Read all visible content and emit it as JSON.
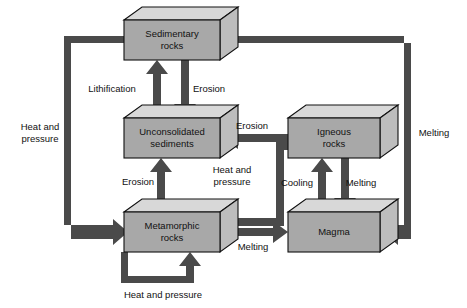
{
  "diagram": {
    "type": "flow-diagram",
    "colors": {
      "box_front": "#a8a8a8",
      "box_top": "#d8d8d8",
      "box_side": "#bdbdbd",
      "box_outline": "#101010",
      "arrow": "#4a4a4a",
      "text": "#111111",
      "background": "#ffffff"
    },
    "nodes": [
      {
        "id": "sedimentary",
        "label_line1": "Sedimentary",
        "label_line2": "rocks",
        "x": 124,
        "y": 20,
        "w": 96,
        "h": 40
      },
      {
        "id": "unconsolidated",
        "label_line1": "Unconsolidated",
        "label_line2": "sediments",
        "x": 124,
        "y": 118,
        "w": 96,
        "h": 40
      },
      {
        "id": "igneous",
        "label_line1": "Igneous",
        "label_line2": "rocks",
        "x": 288,
        "y": 118,
        "w": 92,
        "h": 40
      },
      {
        "id": "metamorphic",
        "label_line1": "Metamorphic",
        "label_line2": "rocks",
        "x": 124,
        "y": 212,
        "w": 96,
        "h": 40
      },
      {
        "id": "magma",
        "label_line1": "Magma",
        "label_line2": "",
        "x": 288,
        "y": 212,
        "w": 92,
        "h": 40
      }
    ],
    "edges": [
      {
        "id": "lithification",
        "label": "Lithification",
        "from": "unconsolidated",
        "to": "sedimentary",
        "label_x": 112,
        "label_y": 89
      },
      {
        "id": "erosion-sed-to-unc",
        "label": "Erosion",
        "from": "sedimentary",
        "to": "unconsolidated",
        "label_x": 209,
        "label_y": 89
      },
      {
        "id": "erosion-ign-to-unc",
        "label": "Erosion",
        "from": "igneous",
        "to": "unconsolidated",
        "label_x": 252,
        "label_y": 126
      },
      {
        "id": "erosion-met-to-unc",
        "label": "Erosion",
        "from": "metamorphic",
        "to": "unconsolidated",
        "label_x": 138,
        "label_y": 182
      },
      {
        "id": "heat-pressure-ign-to-met",
        "label_line1": "Heat and",
        "label_line2": "pressure",
        "from": "igneous",
        "to": "metamorphic",
        "label_x": 232,
        "label_y": 176
      },
      {
        "id": "cooling-magma-to-ign",
        "label": "Cooling",
        "from": "magma",
        "to": "igneous",
        "label_x": 297,
        "label_y": 183
      },
      {
        "id": "melting-ign-to-magma",
        "label": "Melting",
        "from": "igneous",
        "to": "magma",
        "label_x": 361,
        "label_y": 183
      },
      {
        "id": "melting-met-to-magma",
        "label": "Melting",
        "from": "metamorphic",
        "to": "magma",
        "label_x": 253,
        "label_y": 243
      },
      {
        "id": "heat-pressure-sed-to-met",
        "label_line1": "Heat and",
        "label_line2": "pressure",
        "from": "sedimentary",
        "to": "metamorphic",
        "label_x": 40,
        "label_y": 133
      },
      {
        "id": "melting-sed-to-magma",
        "label": "Melting",
        "from": "sedimentary",
        "to": "magma",
        "label_x": 434,
        "label_y": 133
      },
      {
        "id": "heat-pressure-met-self",
        "label": "Heat and pressure",
        "from": "metamorphic",
        "to": "metamorphic",
        "label_x": 163,
        "label_y": 293
      }
    ]
  }
}
